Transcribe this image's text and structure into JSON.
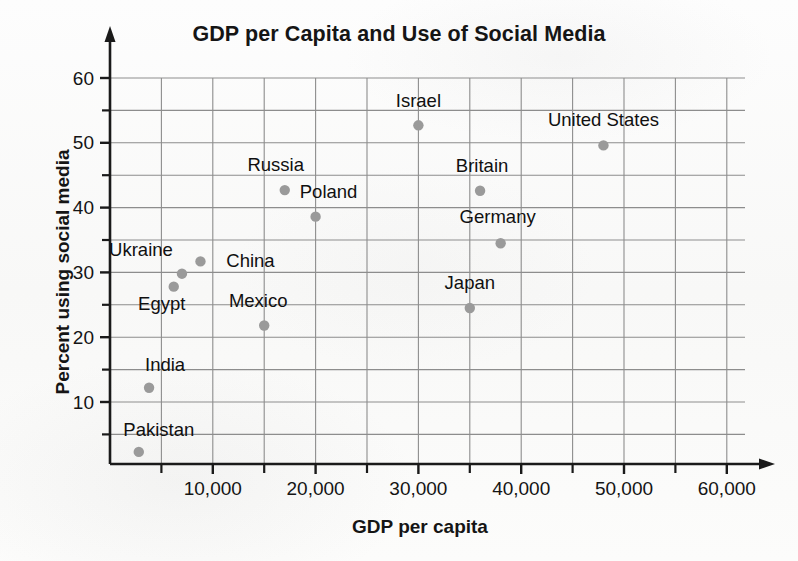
{
  "chart_data": {
    "type": "scatter",
    "title": "GDP per Capita and Use of Social Media",
    "xlabel": "GDP per capita",
    "ylabel": "Percent using social media",
    "xlim": [
      0,
      62500
    ],
    "ylim": [
      0,
      63
    ],
    "grid": true,
    "legend": "none",
    "point_color": "#9a9a9a",
    "axis_color": "#1a1a1a",
    "grid_color": "#8d8d8d",
    "x_ticks": [
      {
        "value": 10000,
        "label": "10,000"
      },
      {
        "value": 20000,
        "label": "20,000"
      },
      {
        "value": 30000,
        "label": "30,000"
      },
      {
        "value": 40000,
        "label": "40,000"
      },
      {
        "value": 50000,
        "label": "50,000"
      },
      {
        "value": 60000,
        "label": "60,000"
      }
    ],
    "x_minor_ticks": [
      5000,
      15000,
      25000,
      35000,
      45000,
      55000
    ],
    "y_ticks": [
      {
        "value": 10,
        "label": "10"
      },
      {
        "value": 20,
        "label": "20"
      },
      {
        "value": 30,
        "label": "30"
      },
      {
        "value": 40,
        "label": "40"
      },
      {
        "value": 50,
        "label": "50"
      },
      {
        "value": 60,
        "label": "60"
      }
    ],
    "y_minor_ticks": [
      5,
      15,
      25,
      35,
      45,
      55
    ],
    "x_gridlines": [
      5000,
      10000,
      15000,
      20000,
      25000,
      30000,
      35000,
      40000,
      45000,
      50000,
      55000,
      60000
    ],
    "y_gridlines": [
      5,
      10,
      15,
      20,
      25,
      30,
      35,
      40,
      45,
      50,
      55,
      60
    ],
    "points": [
      {
        "name": "Pakistan",
        "x": 2800,
        "y": 2.3,
        "label_dx": 20,
        "label_dy": -16
      },
      {
        "name": "India",
        "x": 3800,
        "y": 12.2,
        "label_dx": 16,
        "label_dy": -17
      },
      {
        "name": "Egypt",
        "x": 6200,
        "y": 27.8,
        "label_dx": -12,
        "label_dy": 23
      },
      {
        "name": "Ukraine",
        "x": 7000,
        "y": 29.8,
        "label_dx": -41,
        "label_dy": -18
      },
      {
        "name": "China",
        "x": 8800,
        "y": 31.7,
        "label_dx": 50,
        "label_dy": 6
      },
      {
        "name": "Mexico",
        "x": 15000,
        "y": 21.8,
        "label_dx": -6,
        "label_dy": -19
      },
      {
        "name": "Russia",
        "x": 17000,
        "y": 42.7,
        "label_dx": -9,
        "label_dy": -19
      },
      {
        "name": "Poland",
        "x": 20000,
        "y": 38.6,
        "label_dx": 13,
        "label_dy": -19
      },
      {
        "name": "Israel",
        "x": 30000,
        "y": 52.7,
        "label_dx": 0,
        "label_dy": -18
      },
      {
        "name": "Japan",
        "x": 35000,
        "y": 24.5,
        "label_dx": 0,
        "label_dy": -19
      },
      {
        "name": "Germany",
        "x": 38000,
        "y": 34.5,
        "label_dx": -3,
        "label_dy": -20
      },
      {
        "name": "Britain",
        "x": 36000,
        "y": 42.6,
        "label_dx": 2,
        "label_dy": -19
      },
      {
        "name": "United States",
        "x": 48000,
        "y": 49.6,
        "label_dx": 0,
        "label_dy": -19
      }
    ]
  }
}
